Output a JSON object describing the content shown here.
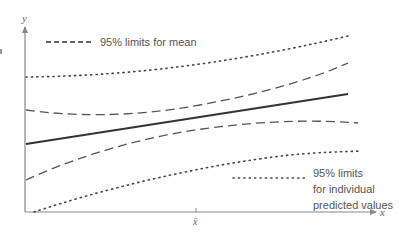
{
  "diagram": {
    "type": "confidence-and-prediction-bands",
    "axes": {
      "x_label": "x",
      "y_label": "y",
      "x_mean_label": "x̄"
    },
    "legend": {
      "mean_limits": {
        "style": "dashed",
        "label": "95% limits for mean"
      },
      "prediction_limits": {
        "style": "dotted",
        "label_lines": [
          "95% limits",
          "for individual",
          "predicted values"
        ]
      }
    },
    "curves": [
      {
        "name": "regression-line",
        "style": "solid"
      },
      {
        "name": "upper-mean-limit",
        "style": "dashed"
      },
      {
        "name": "lower-mean-limit",
        "style": "dashed"
      },
      {
        "name": "upper-prediction-limit",
        "style": "dotted"
      },
      {
        "name": "lower-prediction-limit",
        "style": "dotted"
      }
    ],
    "colors": {
      "line": "#333333",
      "dashed": "#555555",
      "dotted": "#444444",
      "axis": "#888888",
      "text": "#555555"
    }
  }
}
